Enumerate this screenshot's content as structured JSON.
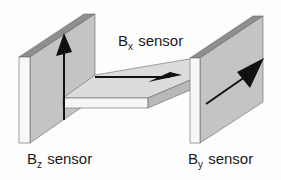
{
  "diagram": {
    "type": "3D sensor arrangement schematic",
    "colors": {
      "face_front": "#f7f7f7",
      "face_side": "#c4c4c4",
      "face_top_edge": "#8e8e8e",
      "plate_top": "#dcdcdc",
      "plate_front": "#f5f5f5",
      "plate_side": "#b8b8b8",
      "outline": "#555555",
      "arrow": "#111111"
    },
    "labels": {
      "bx": {
        "base": "B",
        "sub": "x",
        "suffix": " sensor"
      },
      "bz": {
        "base": "B",
        "sub": "z",
        "suffix": " sensor"
      },
      "by": {
        "base": "B",
        "sub": "y",
        "suffix": " sensor"
      }
    },
    "components": [
      {
        "name": "Bz sensor",
        "shape": "vertical panel",
        "arrow": "up"
      },
      {
        "name": "Bx sensor",
        "shape": "horizontal plate",
        "arrow": "right"
      },
      {
        "name": "By sensor",
        "shape": "vertical panel",
        "arrow": "diagonal back-right"
      }
    ]
  }
}
